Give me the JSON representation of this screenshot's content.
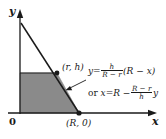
{
  "figure": {
    "type": "geometry-diagram",
    "background_color": "#ffffff",
    "ink_color": "#1a1a1a",
    "shade_color": "#8a8a8a"
  },
  "axes": {
    "y_label": "y",
    "x_label": "x",
    "origin_label": "0"
  },
  "points": [
    {
      "name": "upper-point",
      "label": "(r, h)",
      "x": "r",
      "y": "h"
    },
    {
      "name": "x-intercept",
      "label": "(R, 0)",
      "x": "R",
      "y": "0"
    }
  ],
  "equations": {
    "primary": {
      "lhs": "y",
      "eq": "=",
      "frac_num": "h",
      "frac_den": "R − r",
      "rhs": "(R − x)",
      "plain": "y = h/(R − r) (R − x)"
    },
    "secondary": {
      "prefix": "or",
      "lhs": "x",
      "eq": "=",
      "first_term": "R −",
      "frac_num": "R − r",
      "frac_den": "h",
      "rhs": "y",
      "plain": "or x = R − (R − r)/h y"
    }
  }
}
